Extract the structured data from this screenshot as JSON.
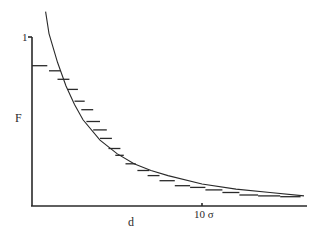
{
  "chart_data": {
    "type": "line",
    "title": "",
    "xlabel": "d",
    "ylabel": "F",
    "x_tick_labels": [
      {
        "value": 10,
        "label": "10 σ"
      }
    ],
    "y_tick_labels": [
      {
        "value": 1,
        "label": "1"
      }
    ],
    "xlim": [
      0,
      16.2
    ],
    "ylim": [
      0,
      1
    ],
    "grid": false,
    "legend": null,
    "series": [
      {
        "name": "theory curve",
        "style": "smooth line",
        "x": [
          0.8,
          1.0,
          1.5,
          2.0,
          2.5,
          3.0,
          4.0,
          5.0,
          6.0,
          7.0,
          8.0,
          10.0,
          12.0,
          14.0,
          16.0
        ],
        "y": [
          1.15,
          1.02,
          0.85,
          0.71,
          0.6,
          0.51,
          0.39,
          0.31,
          0.25,
          0.21,
          0.18,
          0.13,
          0.1,
          0.08,
          0.06
        ]
      },
      {
        "name": "simulation histogram",
        "style": "horizontal step segments",
        "x_start": [
          0.0,
          1.0,
          1.5,
          2.1,
          2.5,
          2.9,
          3.2,
          3.6,
          4.0,
          4.5,
          4.9,
          5.5,
          6.2,
          6.8,
          7.5,
          8.4,
          9.3,
          10.2,
          11.2,
          12.2,
          13.3,
          14.6
        ],
        "x_end": [
          0.9,
          1.7,
          2.2,
          2.7,
          3.1,
          3.6,
          4.0,
          4.4,
          4.7,
          5.2,
          5.4,
          6.1,
          6.9,
          7.5,
          8.4,
          9.3,
          10.2,
          11.2,
          12.2,
          13.3,
          14.6,
          15.8
        ],
        "y": [
          0.83,
          0.8,
          0.75,
          0.69,
          0.62,
          0.57,
          0.5,
          0.45,
          0.4,
          0.34,
          0.3,
          0.25,
          0.21,
          0.18,
          0.15,
          0.12,
          0.11,
          0.095,
          0.08,
          0.065,
          0.06,
          0.055
        ]
      }
    ]
  },
  "labels": {
    "y_axis": "F",
    "x_axis": "d",
    "y_tick_top": "1",
    "x_tick_10": "10 σ"
  },
  "colors": {
    "ink": "#2a2a2a",
    "background": "#ffffff"
  }
}
